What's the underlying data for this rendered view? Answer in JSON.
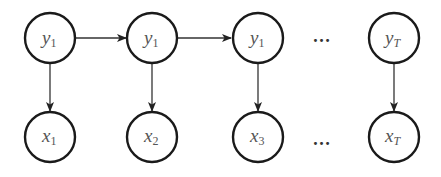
{
  "diagram": {
    "type": "hidden-markov-model",
    "colors": {
      "node_stroke": "#1a1a1a",
      "node_fill": "#ffffff",
      "edge": "#333333",
      "label": "#555555",
      "background": "#ffffff"
    },
    "hidden_nodes": [
      {
        "id": "y1a",
        "main": "y",
        "sub": "1",
        "sub_italic": false
      },
      {
        "id": "y1b",
        "main": "y",
        "sub": "1",
        "sub_italic": false
      },
      {
        "id": "y1c",
        "main": "y",
        "sub": "1",
        "sub_italic": false
      },
      {
        "id": "yT",
        "main": "y",
        "sub": "T",
        "sub_italic": true
      }
    ],
    "observed_nodes": [
      {
        "id": "x1",
        "main": "x",
        "sub": "1",
        "sub_italic": false
      },
      {
        "id": "x2",
        "main": "x",
        "sub": "2",
        "sub_italic": false
      },
      {
        "id": "x3",
        "main": "x",
        "sub": "3",
        "sub_italic": false
      },
      {
        "id": "xT",
        "main": "x",
        "sub": "T",
        "sub_italic": true
      }
    ],
    "ellipsis": {
      "top": "…",
      "bottom": "…"
    },
    "edges": [
      {
        "from": "y1a",
        "to": "y1b",
        "kind": "transition"
      },
      {
        "from": "y1b",
        "to": "y1c",
        "kind": "transition"
      },
      {
        "from": "y1a",
        "to": "x1",
        "kind": "emission"
      },
      {
        "from": "y1b",
        "to": "x2",
        "kind": "emission"
      },
      {
        "from": "y1c",
        "to": "x3",
        "kind": "emission"
      },
      {
        "from": "yT",
        "to": "xT",
        "kind": "emission"
      }
    ]
  }
}
